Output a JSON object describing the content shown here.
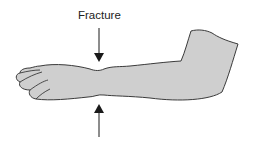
{
  "diagram": {
    "label": "Fracture",
    "arrows": [
      {
        "name": "top-arrow",
        "direction": "down"
      },
      {
        "name": "bottom-arrow",
        "direction": "up"
      }
    ],
    "colors": {
      "arm_fill": "#cfcfcf",
      "outline": "#3a3a3a",
      "arrow": "#1a1a1a",
      "background": "#ffffff"
    }
  }
}
